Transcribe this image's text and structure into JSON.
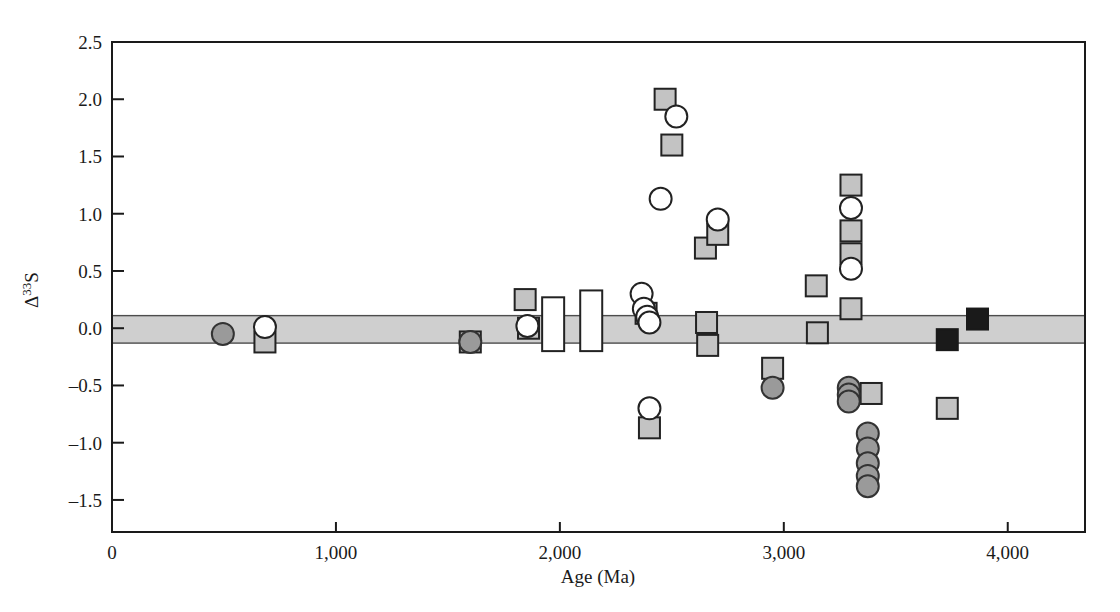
{
  "chart_data": {
    "type": "scatter",
    "title": "",
    "xlabel": "Age (Ma)",
    "ylabel": "Δ33S",
    "ylabel_base": "Δ",
    "ylabel_sup": "33",
    "ylabel_tail": "S",
    "xlim": [
      0,
      4345
    ],
    "ylim": [
      -1.78,
      2.5
    ],
    "grid": false,
    "legend": "none",
    "xticks": [
      0,
      1000,
      2000,
      3000,
      4000
    ],
    "xticklabels": [
      "0",
      "1,000",
      "2,000",
      "3,000",
      "4,000"
    ],
    "yticks": [
      -1.5,
      -1.0,
      -0.5,
      0.0,
      0.5,
      1.0,
      1.5,
      2.0,
      2.5
    ],
    "yticklabels": [
      "–1.5",
      "–1.0",
      "–0.5",
      "0.0",
      "0.5",
      "1.0",
      "1.5",
      "2.0",
      "2.5"
    ],
    "shaded_band": {
      "label": "mass-dependent fractionation band",
      "y_top": 0.11,
      "y_bottom": -0.13,
      "color": "#cfcfcf"
    },
    "series": [
      {
        "name": "gray squares",
        "marker": "square",
        "color": "#c3c3c3",
        "points": [
          [
            683,
            -0.12
          ],
          [
            1600,
            -0.12
          ],
          [
            1845,
            0.25
          ],
          [
            1860,
            0.0
          ],
          [
            2385,
            0.13
          ],
          [
            2400,
            -0.87
          ],
          [
            2470,
            2.0
          ],
          [
            2500,
            1.6
          ],
          [
            2650,
            0.7
          ],
          [
            2655,
            0.05
          ],
          [
            2660,
            -0.15
          ],
          [
            2705,
            0.82
          ],
          [
            2950,
            -0.35
          ],
          [
            3145,
            0.37
          ],
          [
            3150,
            -0.04
          ],
          [
            3300,
            1.25
          ],
          [
            3300,
            0.85
          ],
          [
            3300,
            0.65
          ],
          [
            3300,
            0.17
          ],
          [
            3390,
            -0.57
          ],
          [
            3730,
            -0.7
          ]
        ]
      },
      {
        "name": "black squares",
        "marker": "square",
        "color": "#1a1a1a",
        "points": [
          [
            3730,
            -0.1
          ],
          [
            3865,
            0.08
          ]
        ]
      },
      {
        "name": "open circles",
        "marker": "circle",
        "color": "#ffffff",
        "points": [
          [
            683,
            0.01
          ],
          [
            1855,
            0.02
          ],
          [
            2365,
            0.3
          ],
          [
            2375,
            0.17
          ],
          [
            2390,
            0.1
          ],
          [
            2400,
            0.05
          ],
          [
            2400,
            -0.7
          ],
          [
            2450,
            1.13
          ],
          [
            2520,
            1.85
          ],
          [
            2705,
            0.95
          ],
          [
            3300,
            1.05
          ],
          [
            3300,
            0.52
          ]
        ]
      },
      {
        "name": "dark gray circles",
        "marker": "circle",
        "color": "#9a9a9a",
        "points": [
          [
            495,
            -0.05
          ],
          [
            1600,
            -0.12
          ],
          [
            2950,
            -0.52
          ],
          [
            3290,
            -0.52
          ],
          [
            3290,
            -0.58
          ],
          [
            3290,
            -0.64
          ],
          [
            3375,
            -0.92
          ],
          [
            3375,
            -1.05
          ],
          [
            3375,
            -1.18
          ],
          [
            3375,
            -1.29
          ],
          [
            3375,
            -1.38
          ]
        ]
      },
      {
        "name": "open vertical range bars",
        "marker": "bar",
        "color": "#ffffff",
        "bars": [
          {
            "x": 1970,
            "y_top": 0.27,
            "y_bottom": -0.2
          },
          {
            "x": 2140,
            "y_top": 0.33,
            "y_bottom": -0.2
          }
        ]
      }
    ]
  }
}
